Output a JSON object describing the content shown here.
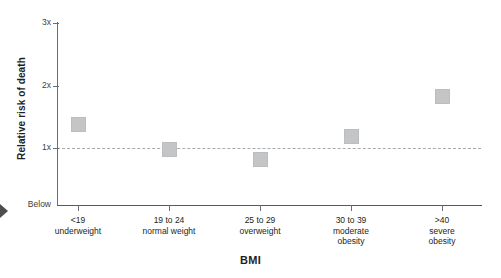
{
  "chart_data": {
    "type": "scatter",
    "title": "",
    "xlabel": "BMI",
    "ylabel": "Relative risk of death",
    "categories": [
      "<19\nunderweight",
      "19 to 24\nnormal weight",
      "25 to 29\noverweight",
      "30 to 39\nmoderate\nobesity",
      ">40\nsevere\nobesity"
    ],
    "category_lines": [
      [
        "<19",
        "underweight"
      ],
      [
        "19 to 24",
        "normal weight"
      ],
      [
        "25 to 29",
        "overweight"
      ],
      [
        "30 to 39",
        "moderate",
        "obesity"
      ],
      [
        ">40",
        "severe",
        "obesity"
      ]
    ],
    "values": [
      1.38,
      0.98,
      0.82,
      1.18,
      1.82
    ],
    "ylim": [
      0,
      3
    ],
    "ytick_labels": [
      "3x",
      "2x",
      "1x",
      "Below"
    ],
    "ytick_values": [
      3,
      2,
      1,
      0
    ],
    "reference_line": {
      "value": 1,
      "style": "dashed",
      "label": "1x"
    },
    "grid": false,
    "legend": null,
    "marker_shape": "square",
    "marker_color": "#c4c5c7"
  },
  "axes": {
    "y_title": "Relative risk of death",
    "x_title": "BMI",
    "y_ticks": [
      {
        "label": "3x",
        "value": 3
      },
      {
        "label": "2x",
        "value": 2
      },
      {
        "label": "1x",
        "value": 1
      },
      {
        "label": "Below",
        "value": 0
      }
    ],
    "x_ticks": [
      {
        "line1": "<19",
        "line2": "underweight",
        "line3": ""
      },
      {
        "line1": "19 to 24",
        "line2": "normal weight",
        "line3": ""
      },
      {
        "line1": "25 to 29",
        "line2": "overweight",
        "line3": ""
      },
      {
        "line1": "30 to 39",
        "line2": "moderate",
        "line3": "obesity"
      },
      {
        "line1": ">40",
        "line2": "severe",
        "line3": "obesity"
      }
    ]
  },
  "colors": {
    "marker": "#c4c5c7",
    "axis": "#6d6e71",
    "reference": "#a7a9ac",
    "text": "#231f20",
    "background": "#ffffff"
  }
}
